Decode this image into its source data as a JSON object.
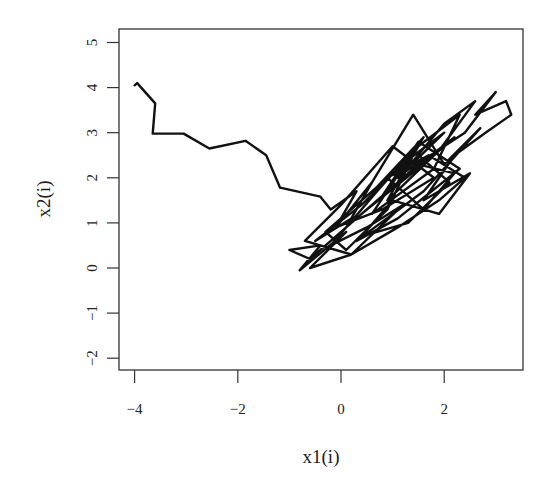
{
  "chart_data": {
    "type": "line",
    "title": "",
    "xlabel": "x1(i)",
    "ylabel": "x2(i)",
    "xlim": [
      -4.3,
      3.5
    ],
    "ylim": [
      -2.25,
      5.3
    ],
    "xticks": [
      -4,
      -2,
      0,
      2
    ],
    "xtick_labels": [
      "−4",
      "−2",
      "0",
      "2"
    ],
    "yticks": [
      -2,
      -1,
      0,
      1,
      2,
      3,
      4,
      5
    ],
    "ytick_labels": [
      "−2",
      "−1",
      "0",
      "1",
      "2",
      "3",
      "4",
      "5"
    ],
    "grid": false,
    "legend": null,
    "line_color": "#111111",
    "series": [
      {
        "name": "trajectory",
        "x": [
          -4.0,
          -3.95,
          -3.6,
          -3.65,
          -3.05,
          -2.55,
          -1.85,
          -1.45,
          -1.18,
          -0.4,
          -0.2,
          0.3,
          -0.1,
          0.6,
          0.2,
          -0.5,
          0.4,
          1.1,
          0.5,
          -0.3,
          0.1,
          0.9,
          1.4,
          0.7,
          1.6,
          1.1,
          2.0,
          1.3,
          0.6,
          1.8,
          2.3,
          1.5,
          0.9,
          1.9,
          2.6,
          2.0,
          1.2,
          2.4,
          3.0,
          2.6,
          3.2,
          3.3,
          2.8,
          2.2,
          1.6,
          2.5,
          1.9,
          1.0,
          0.4,
          1.3,
          2.1,
          1.4,
          0.7,
          -0.2,
          0.5,
          1.2,
          0.2,
          -0.6,
          0.1,
          -0.8,
          -0.4,
          -1.0,
          -0.6,
          0.3,
          1.0,
          0.4,
          1.7,
          2.2,
          1.3,
          0.8,
          1.5,
          2.3,
          1.1,
          0.3,
          1.6,
          2.7,
          2.0,
          1.4,
          0.6,
          -0.1,
          0.8,
          1.8,
          1.0,
          0.0,
          -0.7,
          0.2,
          1.1,
          1.9,
          2.4,
          1.7,
          0.9,
          1.6,
          2.2,
          1.5
        ],
        "y": [
          4.05,
          4.1,
          3.65,
          2.98,
          2.98,
          2.65,
          2.82,
          2.5,
          1.78,
          1.58,
          1.3,
          1.7,
          0.9,
          1.9,
          1.1,
          0.6,
          1.4,
          2.2,
          1.6,
          0.8,
          0.4,
          1.3,
          2.5,
          1.8,
          2.9,
          2.0,
          3.0,
          2.4,
          1.2,
          2.2,
          3.4,
          2.7,
          1.5,
          2.6,
          3.7,
          3.2,
          2.1,
          3.0,
          3.9,
          3.4,
          3.7,
          3.4,
          3.0,
          2.5,
          1.5,
          2.1,
          1.2,
          1.5,
          0.7,
          1.0,
          1.9,
          2.6,
          1.7,
          0.5,
          0.9,
          1.4,
          0.3,
          0.0,
          0.8,
          -0.05,
          0.5,
          0.4,
          0.2,
          1.1,
          1.8,
          1.2,
          2.4,
          2.9,
          2.1,
          1.6,
          2.8,
          2.2,
          1.1,
          0.6,
          1.7,
          3.1,
          2.3,
          3.4,
          1.9,
          0.9,
          1.3,
          2.0,
          2.7,
          1.4,
          0.6,
          0.3,
          0.9,
          1.5,
          2.0,
          2.5,
          2.0,
          1.3,
          2.1,
          2.3
        ]
      }
    ]
  }
}
